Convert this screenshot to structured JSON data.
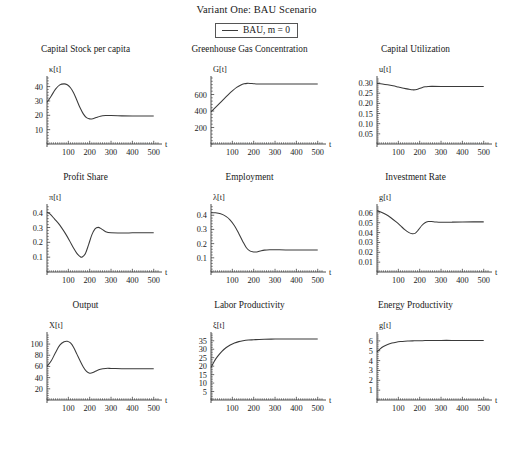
{
  "figure": {
    "title": "Variant One: BAU Scenario",
    "legend": {
      "label": "BAU, m = 0",
      "line_color": "#3a3a3a"
    },
    "caption": ""
  },
  "chart_data": [
    {
      "type": "line",
      "title": "Capital Stock per capita",
      "ylabel": "κ[t]",
      "xlabel": "t",
      "xlim": [
        0,
        520
      ],
      "ylim": [
        0,
        46
      ],
      "xticks": [
        100,
        200,
        300,
        400,
        500
      ],
      "yticks": [
        10,
        20,
        30,
        40
      ],
      "grid": false,
      "series": [
        {
          "name": "BAU, m = 0",
          "x": [
            0,
            20,
            40,
            60,
            80,
            95,
            110,
            125,
            140,
            155,
            170,
            185,
            200,
            215,
            230,
            250,
            275,
            300,
            350,
            400,
            450,
            500
          ],
          "y": [
            29,
            33.5,
            38.2,
            41.2,
            41.9,
            41.3,
            39.2,
            35.6,
            30.5,
            25.2,
            21.0,
            18.4,
            17.5,
            17.6,
            18.4,
            19.4,
            19.8,
            19.8,
            19.6,
            19.5,
            19.5,
            19.5
          ]
        }
      ]
    },
    {
      "type": "line",
      "title": "Greenhouse Gas Concentration",
      "ylabel": "G[t]",
      "xlabel": "t",
      "xlim": [
        0,
        520
      ],
      "ylim": [
        0,
        800
      ],
      "xticks": [
        100,
        200,
        300,
        400,
        500
      ],
      "yticks": [
        200,
        400,
        600
      ],
      "grid": false,
      "series": [
        {
          "name": "BAU, m = 0",
          "x": [
            0,
            20,
            40,
            60,
            80,
            100,
            120,
            140,
            155,
            170,
            185,
            200,
            225,
            250,
            300,
            350,
            400,
            450,
            500
          ],
          "y": [
            390,
            440,
            492,
            545,
            596,
            644,
            686,
            716,
            730,
            735,
            734,
            731,
            728,
            727,
            727,
            728,
            728,
            728,
            728
          ]
        }
      ]
    },
    {
      "type": "line",
      "title": "Capital Utilization",
      "ylabel": "u[t]",
      "xlabel": "t",
      "xlim": [
        0,
        520
      ],
      "ylim": [
        0,
        0.325
      ],
      "xticks": [
        100,
        200,
        300,
        400,
        500
      ],
      "yticks": [
        0.05,
        0.1,
        0.15,
        0.2,
        0.25,
        0.3
      ],
      "grid": false,
      "series": [
        {
          "name": "BAU, m = 0",
          "x": [
            0,
            25,
            50,
            75,
            100,
            125,
            150,
            165,
            180,
            195,
            210,
            225,
            240,
            260,
            300,
            350,
            400,
            450,
            500
          ],
          "y": [
            0.2985,
            0.2955,
            0.2915,
            0.2865,
            0.2805,
            0.2745,
            0.2695,
            0.2668,
            0.2672,
            0.2715,
            0.2775,
            0.2818,
            0.2835,
            0.2838,
            0.2832,
            0.2828,
            0.2827,
            0.2827,
            0.2827
          ]
        }
      ]
    },
    {
      "type": "line",
      "title": "Profit Share",
      "ylabel": "π[t]",
      "xlabel": "t",
      "xlim": [
        0,
        520
      ],
      "ylim": [
        0,
        0.445
      ],
      "xticks": [
        100,
        200,
        300,
        400,
        500
      ],
      "yticks": [
        0.1,
        0.2,
        0.3,
        0.4
      ],
      "grid": false,
      "series": [
        {
          "name": "BAU, m = 0",
          "x": [
            0,
            15,
            35,
            60,
            85,
            105,
            125,
            140,
            155,
            165,
            180,
            195,
            210,
            225,
            240,
            255,
            275,
            300,
            350,
            400,
            450,
            500
          ],
          "y": [
            0.404,
            0.39,
            0.358,
            0.316,
            0.262,
            0.213,
            0.16,
            0.126,
            0.104,
            0.101,
            0.125,
            0.185,
            0.25,
            0.291,
            0.301,
            0.291,
            0.272,
            0.264,
            0.263,
            0.264,
            0.265,
            0.265
          ]
        }
      ]
    },
    {
      "type": "line",
      "title": "Employment",
      "ylabel": "λ[t]",
      "xlabel": "t",
      "xlim": [
        0,
        520
      ],
      "ylim": [
        0,
        0.465
      ],
      "xticks": [
        100,
        200,
        300,
        400,
        500
      ],
      "yticks": [
        0.1,
        0.2,
        0.3,
        0.4
      ],
      "grid": false,
      "series": [
        {
          "name": "BAU, m = 0",
          "x": [
            0,
            20,
            45,
            70,
            90,
            110,
            130,
            150,
            165,
            180,
            195,
            210,
            230,
            250,
            275,
            300,
            350,
            400,
            450,
            500
          ],
          "y": [
            0.418,
            0.417,
            0.41,
            0.392,
            0.366,
            0.326,
            0.272,
            0.212,
            0.173,
            0.151,
            0.142,
            0.141,
            0.148,
            0.154,
            0.157,
            0.157,
            0.155,
            0.155,
            0.155,
            0.155
          ]
        }
      ]
    },
    {
      "type": "line",
      "title": "Investment Rate",
      "ylabel": "g[t]",
      "xlabel": "t",
      "xlim": [
        0,
        520
      ],
      "ylim": [
        0,
        0.067
      ],
      "xticks": [
        100,
        200,
        300,
        400,
        500
      ],
      "yticks": [
        0.01,
        0.02,
        0.03,
        0.04,
        0.05,
        0.06
      ],
      "grid": false,
      "series": [
        {
          "name": "BAU, m = 0",
          "x": [
            0,
            15,
            40,
            65,
            90,
            110,
            130,
            150,
            165,
            180,
            195,
            210,
            225,
            240,
            255,
            275,
            300,
            350,
            400,
            450,
            500
          ],
          "y": [
            0.0622,
            0.0612,
            0.0586,
            0.0551,
            0.0508,
            0.047,
            0.043,
            0.04,
            0.0389,
            0.0395,
            0.043,
            0.0472,
            0.05,
            0.0512,
            0.0513,
            0.0508,
            0.0505,
            0.0506,
            0.0508,
            0.0509,
            0.0509
          ]
        }
      ]
    },
    {
      "type": "line",
      "title": "Output",
      "ylabel": "X[t]",
      "xlabel": "t",
      "xlim": [
        0,
        520
      ],
      "ylim": [
        0,
        118
      ],
      "xticks": [
        100,
        200,
        300,
        400,
        500
      ],
      "yticks": [
        20,
        40,
        60,
        80,
        100
      ],
      "grid": false,
      "series": [
        {
          "name": "BAU, m = 0",
          "x": [
            0,
            20,
            40,
            60,
            80,
            95,
            110,
            125,
            140,
            155,
            170,
            185,
            200,
            215,
            230,
            250,
            275,
            300,
            350,
            400,
            450,
            500
          ],
          "y": [
            60,
            70,
            85,
            98,
            104,
            105,
            102,
            94,
            82,
            70,
            59,
            51,
            48,
            49,
            52,
            55,
            56.5,
            56.5,
            56,
            56,
            56,
            56
          ]
        }
      ]
    },
    {
      "type": "line",
      "title": "Labor Productivity",
      "ylabel": "ξ[t]",
      "xlabel": "t",
      "xlim": [
        0,
        520
      ],
      "ylim": [
        0,
        39
      ],
      "xticks": [
        100,
        200,
        300,
        400,
        500
      ],
      "yticks": [
        5,
        10,
        15,
        20,
        25,
        30,
        35
      ],
      "grid": false,
      "series": [
        {
          "name": "BAU, m = 0",
          "x": [
            0,
            15,
            30,
            50,
            70,
            90,
            110,
            130,
            150,
            175,
            200,
            225,
            250,
            300,
            350,
            400,
            450,
            500
          ],
          "y": [
            19.2,
            22.8,
            25.6,
            28.6,
            30.9,
            32.5,
            33.7,
            34.5,
            35.0,
            35.4,
            35.6,
            35.8,
            35.9,
            36.0,
            36.0,
            36.0,
            36.0,
            36.0
          ]
        }
      ]
    },
    {
      "type": "line",
      "title": "Energy Productivity",
      "ylabel": "g[t]",
      "xlabel": "t",
      "xlim": [
        0,
        520
      ],
      "ylim": [
        0,
        6.7
      ],
      "xticks": [
        100,
        200,
        300,
        400,
        500
      ],
      "yticks": [
        1,
        2,
        3,
        4,
        5,
        6
      ],
      "grid": false,
      "series": [
        {
          "name": "BAU, m = 0",
          "x": [
            0,
            15,
            30,
            50,
            70,
            90,
            110,
            130,
            150,
            175,
            200,
            225,
            250,
            300,
            350,
            400,
            450,
            500
          ],
          "y": [
            4.88,
            5.2,
            5.43,
            5.64,
            5.78,
            5.87,
            5.93,
            5.97,
            5.99,
            6.01,
            6.02,
            6.03,
            6.04,
            6.05,
            6.05,
            6.05,
            6.05,
            6.05
          ]
        }
      ]
    }
  ]
}
